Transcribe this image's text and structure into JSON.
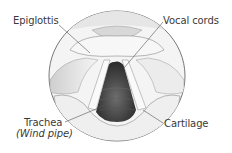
{
  "diagram": {
    "labels": [
      {
        "id": "epiglottis",
        "text": "Epiglottis"
      },
      {
        "id": "vocal-cords",
        "text": "Vocal cords"
      },
      {
        "id": "trachea",
        "text": "Trachea",
        "sub": "(Wind pipe)"
      },
      {
        "id": "cartilage",
        "text": "Cartilage"
      }
    ],
    "colors": {
      "text": "#3a3a3a",
      "outline": "#555555",
      "tissue_light": "#f2f2f2",
      "tissue_shade": "#bdbdbd",
      "opening_dark": "#3c3c3c"
    }
  }
}
